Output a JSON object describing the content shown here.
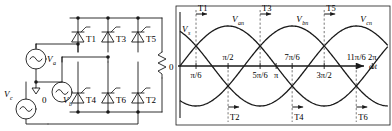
{
  "figure": {
    "line_color": "#1a1a1a",
    "dash_color": "#555555"
  },
  "circuit": {
    "sources": [
      {
        "id": "va",
        "label": "V",
        "sub": "a"
      },
      {
        "id": "vb",
        "label": "V",
        "sub": "b"
      },
      {
        "id": "vc",
        "label": "V",
        "sub": "c"
      }
    ],
    "neutral_label": "0",
    "thyristors_top": [
      {
        "id": "t1",
        "label": "T1"
      },
      {
        "id": "t3",
        "label": "T3"
      },
      {
        "id": "t5",
        "label": "T5"
      }
    ],
    "thyristors_bottom": [
      {
        "id": "t4",
        "label": "T4"
      },
      {
        "id": "t6",
        "label": "T6"
      },
      {
        "id": "t2",
        "label": "T2"
      }
    ],
    "load": {
      "id": "load-resistor",
      "label": ""
    }
  },
  "chart_data": {
    "type": "line",
    "title": "",
    "xlabel": "ωt",
    "ylabel": "V",
    "ylabel_sub": "s",
    "origin_label": "0",
    "xlim": [
      0,
      6.8067
    ],
    "ylim": [
      -1.35,
      1.35
    ],
    "grid": false,
    "legend_position": "inline-above-peaks",
    "x_ticks_above": [
      {
        "value": 1.5708,
        "text": "π/2"
      },
      {
        "value": 3.6652,
        "text": "7π/6"
      },
      {
        "value": 5.7596,
        "text": "11π/6"
      },
      {
        "value": 6.2832,
        "text": "2π"
      }
    ],
    "x_ticks_below": [
      {
        "value": 0.5236,
        "text": "π/6"
      },
      {
        "value": 2.618,
        "text": "5π/6"
      },
      {
        "value": 3.1416,
        "text": "π"
      },
      {
        "value": 4.7124,
        "text": "3π/2"
      }
    ],
    "series": [
      {
        "name": "V",
        "sub": "an",
        "phase_deg": 0,
        "amplitude": 1,
        "peak_label_x": 1.5708
      },
      {
        "name": "V",
        "sub": "bn",
        "phase_deg": -120,
        "amplitude": 1,
        "peak_label_x": 3.6652
      },
      {
        "name": "V",
        "sub": "cn",
        "phase_deg": -240,
        "amplitude": 1,
        "peak_label_x": 5.7596
      }
    ],
    "firing_markers_top": [
      {
        "label": "T1",
        "value": 0.5236
      },
      {
        "label": "T3",
        "value": 2.618
      },
      {
        "label": "T5",
        "value": 4.7124
      }
    ],
    "firing_markers_bottom": [
      {
        "label": "T2",
        "value": 1.5708
      },
      {
        "label": "T4",
        "value": 3.6652
      },
      {
        "label": "T6",
        "value": 5.7596
      }
    ]
  }
}
